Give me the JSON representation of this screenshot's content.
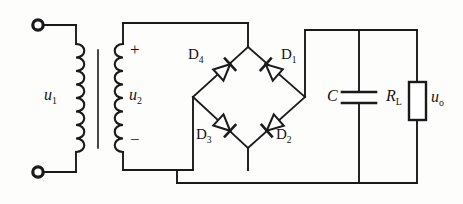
{
  "figure": {
    "name": "bridge-rectifier-with-capacitor-filter",
    "background_color": "#fdfdfc",
    "line_color": "#1a1a1a"
  },
  "transformer": {
    "primary_label": "u",
    "primary_sub": "1",
    "secondary_label": "u",
    "secondary_sub": "2",
    "secondary_plus": "+",
    "secondary_minus": "−",
    "terminal_top_name": "input-terminal-top",
    "terminal_bottom_name": "input-terminal-bottom"
  },
  "bridge": {
    "diodes": [
      {
        "id": "D4",
        "letter": "D",
        "sub": "4",
        "position": "top-left"
      },
      {
        "id": "D1",
        "letter": "D",
        "sub": "1",
        "position": "top-right"
      },
      {
        "id": "D3",
        "letter": "D",
        "sub": "3",
        "position": "bottom-left"
      },
      {
        "id": "D2",
        "letter": "D",
        "sub": "2",
        "position": "bottom-right"
      }
    ]
  },
  "output_stage": {
    "capacitor_label": "C",
    "load_label": "R",
    "load_sub": "L",
    "output_label": "u",
    "output_sub": "o"
  }
}
